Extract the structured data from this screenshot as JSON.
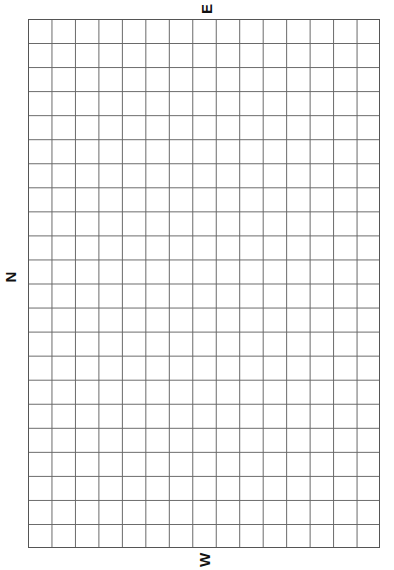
{
  "compass": {
    "top": "E",
    "left": "N",
    "bottom": "W"
  },
  "grid": {
    "columns": 15,
    "rows": 22,
    "line_color": "#666666",
    "background": "#ffffff"
  }
}
